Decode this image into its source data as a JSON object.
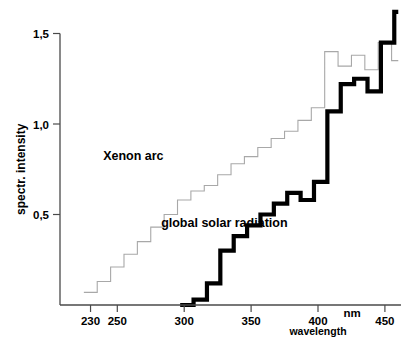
{
  "chart_data": {
    "type": "line",
    "title": "",
    "subtitle": "",
    "xlabel": "wavelength",
    "xunit": "nm",
    "ylabel": "spectr. intensity",
    "xlim": [
      218,
      462
    ],
    "ylim": [
      0,
      1.7
    ],
    "grid": false,
    "legend_position": "inline-annotations",
    "x_ticks": [
      230,
      250,
      300,
      350,
      400,
      450
    ],
    "x_tick_labels": [
      "230",
      "250",
      "300",
      "350",
      "400",
      "450"
    ],
    "y_ticks": [
      0.5,
      1.0,
      1.5
    ],
    "y_tick_labels": [
      "0,5",
      "1,0",
      "1,5"
    ],
    "step_style": "post",
    "annotations": [
      {
        "text": "Xenon arc",
        "x": 262,
        "y": 0.8
      },
      {
        "text": "global solar radiation",
        "x": 330,
        "y": 0.43
      }
    ],
    "series": [
      {
        "name": "Xenon arc",
        "color": "#a8a8a8",
        "line_width": 1.1,
        "x": [
          225,
          230,
          235,
          240,
          245,
          250,
          255,
          260,
          265,
          270,
          275,
          280,
          285,
          290,
          295,
          300,
          305,
          310,
          315,
          320,
          325,
          330,
          335,
          340,
          345,
          350,
          355,
          360,
          365,
          370,
          375,
          380,
          385,
          390,
          395,
          400,
          405,
          410,
          415,
          420,
          425,
          430,
          435,
          440,
          445,
          450,
          455,
          460
        ],
        "values": [
          0.07,
          0.07,
          0.13,
          0.13,
          0.21,
          0.21,
          0.28,
          0.28,
          0.35,
          0.35,
          0.43,
          0.43,
          0.5,
          0.5,
          0.58,
          0.58,
          0.63,
          0.63,
          0.66,
          0.66,
          0.72,
          0.72,
          0.78,
          0.78,
          0.82,
          0.82,
          0.87,
          0.87,
          0.92,
          0.92,
          0.96,
          0.96,
          1.02,
          1.02,
          1.09,
          1.09,
          1.4,
          1.4,
          1.32,
          1.32,
          1.38,
          1.38,
          1.3,
          1.3,
          1.45,
          1.45,
          1.35,
          1.35
        ]
      },
      {
        "name": "global solar radiation",
        "color": "#000000",
        "line_width": 4.2,
        "x": [
          297,
          302,
          307,
          312,
          317,
          322,
          327,
          332,
          337,
          342,
          347,
          352,
          357,
          362,
          367,
          372,
          377,
          382,
          387,
          392,
          397,
          402,
          407,
          412,
          417,
          422,
          427,
          432,
          437,
          442,
          447,
          452,
          457,
          460
        ],
        "values": [
          0.0,
          0.0,
          0.03,
          0.03,
          0.12,
          0.12,
          0.3,
          0.3,
          0.38,
          0.38,
          0.44,
          0.44,
          0.5,
          0.5,
          0.56,
          0.56,
          0.62,
          0.62,
          0.58,
          0.58,
          0.68,
          0.68,
          1.07,
          1.07,
          1.22,
          1.22,
          1.25,
          1.25,
          1.18,
          1.18,
          1.45,
          1.45,
          1.62,
          1.62
        ]
      }
    ]
  },
  "axes": {
    "y_axis_name": "spectr. intensity",
    "x_axis_name": "wavelength",
    "x_axis_unit": "nm"
  },
  "colors": {
    "xenon": "#a8a8a8",
    "solar": "#000000",
    "axis": "#4a4a4a",
    "background": "#ffffff"
  }
}
